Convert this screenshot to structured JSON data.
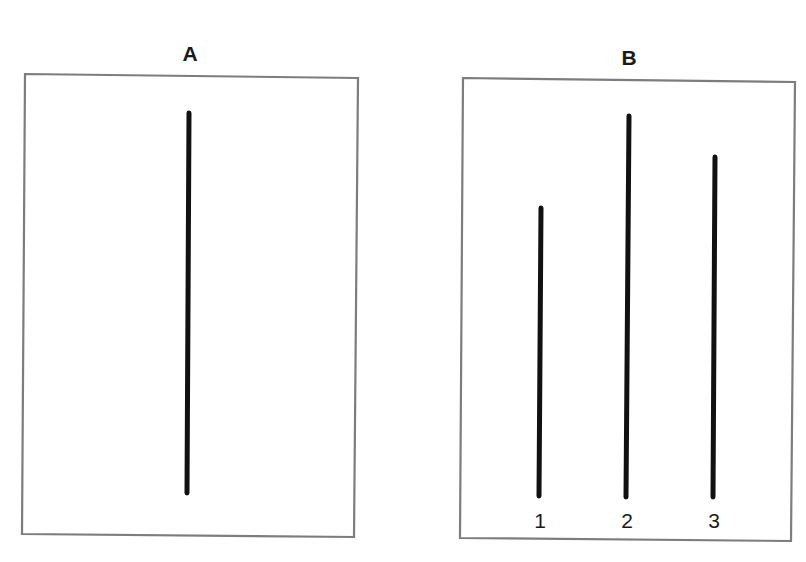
{
  "figure": {
    "panels": [
      {
        "id": "A",
        "title": "A",
        "role": "reference",
        "frame": {
          "points": "25,74 358,78 354,537 22,534"
        },
        "lines": [
          {
            "label": "",
            "x1": 189,
            "y1": 113,
            "x2": 187,
            "y2": 493,
            "relative_length": 380
          }
        ]
      },
      {
        "id": "B",
        "title": "B",
        "role": "comparison",
        "frame": {
          "points": "463,78 795,82 791,541 460,538"
        },
        "lines": [
          {
            "label": "1",
            "x1": 541,
            "y1": 208,
            "x2": 539,
            "y2": 496,
            "relative_length": 288
          },
          {
            "label": "2",
            "x1": 629,
            "y1": 116,
            "x2": 626,
            "y2": 497,
            "relative_length": 381
          },
          {
            "label": "3",
            "x1": 715,
            "y1": 157,
            "x2": 713,
            "y2": 497,
            "relative_length": 340
          }
        ]
      }
    ],
    "colors": {
      "frame": "#7d7d7d",
      "line": "#111111",
      "text": "#1a1a1a",
      "background": "#ffffff"
    }
  }
}
